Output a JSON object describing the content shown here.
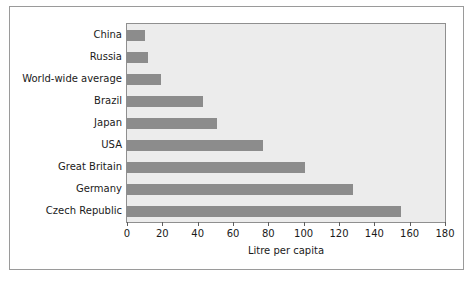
{
  "chart_data": {
    "type": "bar",
    "orientation": "horizontal",
    "title": "",
    "xlabel": "Litre per capita",
    "ylabel": "",
    "xlim": [
      0,
      180
    ],
    "xticks": [
      0,
      20,
      40,
      60,
      80,
      100,
      120,
      140,
      160,
      180
    ],
    "grid": false,
    "legend": false,
    "categories": [
      "China",
      "Russia",
      "World-wide average",
      "Brazil",
      "Japan",
      "USA",
      "Great Britain",
      "Germany",
      "Czech Republic"
    ],
    "values": [
      10,
      12,
      19,
      43,
      51,
      77,
      101,
      128,
      155
    ],
    "colors": {
      "bar": "#8c8c8c",
      "plot_background": "#ececec",
      "figure_background": "#ffffff",
      "axis": "#8f8f8f",
      "text": "#1a1a1a"
    }
  }
}
